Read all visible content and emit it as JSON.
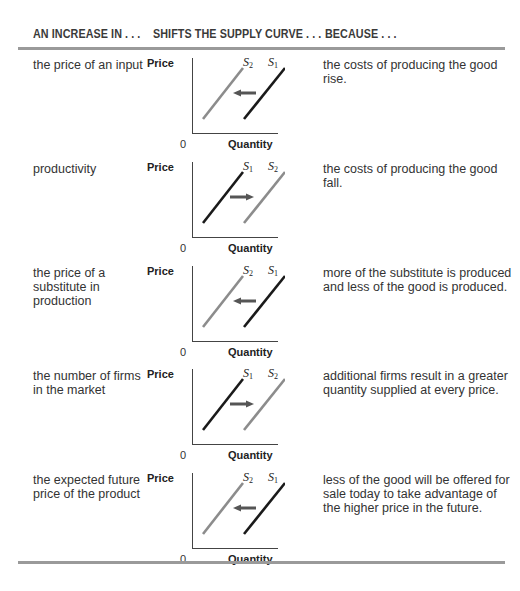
{
  "header": {
    "col1": "AN INCREASE IN . . .",
    "col2": "SHIFTS THE SUPPLY CURVE . . .",
    "col3": "BECAUSE . . ."
  },
  "axis": {
    "y_label": "Price",
    "x_label": "Quantity",
    "origin": "0"
  },
  "colors": {
    "original_curve": "#1a1a1a",
    "new_curve": "#8c8c8c",
    "arrow": "#555555",
    "rule": "#9a9a9a"
  },
  "rows": [
    {
      "factor": "the price of an input",
      "shift": "left",
      "left_curve": "S",
      "left_sub": "2",
      "right_curve": "S",
      "right_sub": "1",
      "reason": "the costs of producing the good rise."
    },
    {
      "factor": "productivity",
      "shift": "right",
      "left_curve": "S",
      "left_sub": "1",
      "right_curve": "S",
      "right_sub": "2",
      "reason": "the costs of producing the good fall."
    },
    {
      "factor": "the price of a substitute in production",
      "shift": "left",
      "left_curve": "S",
      "left_sub": "2",
      "right_curve": "S",
      "right_sub": "1",
      "reason": "more of the substitute is produced and less of the good is produced."
    },
    {
      "factor": "the number of firms in the market",
      "shift": "right",
      "left_curve": "S",
      "left_sub": "1",
      "right_curve": "S",
      "right_sub": "2",
      "reason": "additional firms result in a greater quantity supplied at every price."
    },
    {
      "factor": "the expected future price of the product",
      "shift": "left",
      "left_curve": "S",
      "left_sub": "2",
      "right_curve": "S",
      "right_sub": "1",
      "reason": "less of the good will be offered for sale today to take advantage of the higher price in the future."
    }
  ]
}
